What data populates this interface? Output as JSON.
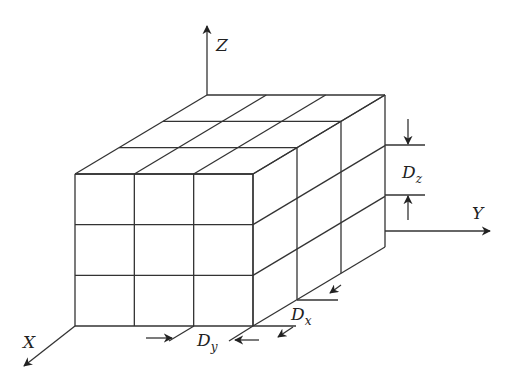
{
  "diagram": {
    "grid": {
      "nx": 3,
      "ny": 3,
      "nz": 3
    },
    "axes": {
      "x": {
        "label": "X"
      },
      "y": {
        "label": "Y"
      },
      "z": {
        "label": "Z"
      }
    },
    "dimensions": {
      "dx": {
        "label": "D",
        "sub": "x"
      },
      "dy": {
        "label": "D",
        "sub": "y"
      },
      "dz": {
        "label": "D",
        "sub": "z"
      }
    },
    "colors": {
      "line": "#333333",
      "background": "#ffffff"
    }
  }
}
